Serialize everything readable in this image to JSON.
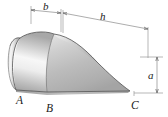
{
  "figure": {
    "background_color": "#ffffff",
    "line_color": "#4a4a4a",
    "dimension_line_color": "#8a8a8a",
    "body_fill_light": "#f2f2f2",
    "body_fill_mid": "#c9c9c9",
    "body_fill_dark": "#9e9e9e"
  },
  "dimensions": [
    {
      "id": "b",
      "label": "b",
      "orientation": "horizontal",
      "position": "top-left"
    },
    {
      "id": "h",
      "label": "h",
      "orientation": "slanted",
      "position": "top-right"
    },
    {
      "id": "a",
      "label": "a",
      "orientation": "vertical",
      "position": "right"
    }
  ],
  "vertices": [
    {
      "id": "A",
      "label": "A",
      "position": "bottom-left"
    },
    {
      "id": "B",
      "label": "B",
      "position": "bottom-center"
    },
    {
      "id": "C",
      "label": "C",
      "position": "bottom-right"
    }
  ],
  "labels": {
    "b": "b",
    "h": "h",
    "a": "a",
    "A": "A",
    "B": "B",
    "C": "C"
  }
}
